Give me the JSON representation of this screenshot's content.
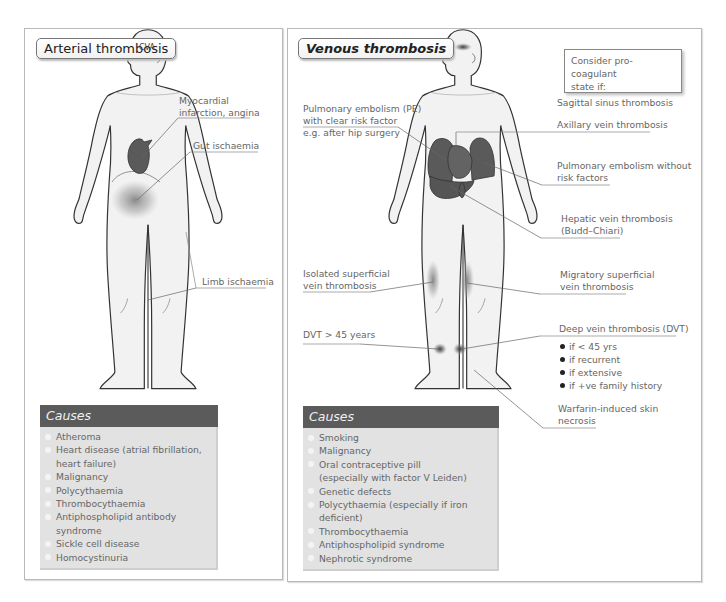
{
  "left_panel": {
    "title": "Arterial thrombosis",
    "head_label": "CVA",
    "labels": {
      "mi": [
        "Myocardial",
        "infarction, angina"
      ],
      "gut": "Gut ischaemia",
      "limb": "Limb ischaemia"
    },
    "causes": {
      "header": "Causes",
      "items": [
        "Atheroma",
        "Heart disease (atrial fibrillation,",
        "heart failure)",
        "Malignancy",
        "Polycythaemia",
        "Thrombocythaemia",
        "Antiphospholipid antibody syndrome",
        "Sickle cell disease",
        "Homocystinuria"
      ]
    }
  },
  "right_panel": {
    "title": "Venous thrombosis",
    "pro_coagulant_box": [
      "Consider pro-coagulant",
      "state if:"
    ],
    "left_labels": {
      "pe": [
        "Pulmonary embolism (PE)",
        "with clear risk factor",
        "e.g. after hip surgery"
      ],
      "superficial": [
        "Isolated superficial",
        "vein thrombosis"
      ],
      "dvt_old": "DVT > 45 years"
    },
    "right_labels": {
      "sagittal": "Sagittal sinus thrombosis",
      "axillary": "Axillary vein thrombosis",
      "pe_no_risk": [
        "Pulmonary embolism without",
        "risk factors"
      ],
      "hepatic": [
        "Hepatic vein thrombosis",
        "(Budd–Chiari)"
      ],
      "migratory": [
        "Migratory superficial",
        "vein thrombosis"
      ],
      "dvt": "Deep vein thrombosis (DVT)",
      "dvt_conditions": [
        "if < 45 yrs",
        "if recurrent",
        "if extensive",
        "if +ve family history"
      ],
      "warfarin": [
        "Warfarin-induced skin",
        "necrosis"
      ]
    },
    "causes": {
      "header": "Causes",
      "items": [
        "Smoking",
        "Malignancy",
        "Oral contraceptive pill",
        "(especially with factor V Leiden)",
        "Genetic defects",
        "Polycythaemia (especially if iron deficient)",
        "Thrombocythaemia",
        "Antiphospholipid syndrome",
        "Nephrotic syndrome"
      ]
    }
  },
  "colors": {
    "organ": "#5a5a5a",
    "causes_header": "#5b5b5b",
    "causes_body": "#e2e2e2",
    "body_fill": "#f2f2f2",
    "outline": "#333333"
  }
}
